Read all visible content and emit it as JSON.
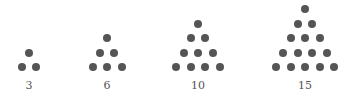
{
  "dot_color": "#555555",
  "triangles": [
    {
      "label": "3",
      "rows": 2,
      "center_x": 29
    },
    {
      "label": "6",
      "rows": 3,
      "center_x": 107
    },
    {
      "label": "10",
      "rows": 4,
      "center_x": 198
    },
    {
      "label": "15",
      "rows": 5,
      "center_x": 305
    }
  ]
}
